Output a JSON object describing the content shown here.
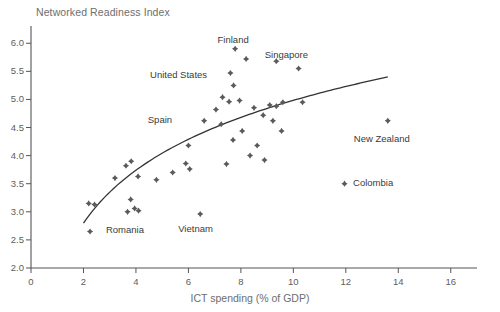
{
  "chart_data": {
    "type": "scatter",
    "title": "Networked Readiness Index",
    "xlabel": "ICT spending (% of GDP)",
    "ylabel": "Networked Readiness Index",
    "xlim": [
      0,
      17
    ],
    "ylim": [
      2.0,
      6.2
    ],
    "xticks": [
      0,
      2,
      4,
      6,
      8,
      10,
      12,
      14,
      16
    ],
    "xtick_labels": [
      "0",
      "2",
      "4",
      "6",
      "8",
      "10",
      "12",
      "14",
      "16"
    ],
    "yticks": [
      2.0,
      2.5,
      3.0,
      3.5,
      4.0,
      4.5,
      5.0,
      5.5,
      6.0
    ],
    "ytick_labels": [
      "2.0",
      "2.5",
      "3.0",
      "3.5",
      "4.0",
      "4.5",
      "5.0",
      "5.5",
      "6.0"
    ],
    "grid": false,
    "legend": null,
    "marker_color": "#5a5a5a",
    "trend_color": "#333333",
    "axis_color": "#555555",
    "points": [
      {
        "x": 2.25,
        "y": 2.65,
        "label": "Romania"
      },
      {
        "x": 2.2,
        "y": 3.15,
        "label": null
      },
      {
        "x": 2.42,
        "y": 3.13,
        "label": null
      },
      {
        "x": 3.2,
        "y": 3.6,
        "label": null
      },
      {
        "x": 3.62,
        "y": 3.82,
        "label": null
      },
      {
        "x": 3.82,
        "y": 3.9,
        "label": null
      },
      {
        "x": 3.68,
        "y": 3.0,
        "label": null
      },
      {
        "x": 3.8,
        "y": 3.22,
        "label": null
      },
      {
        "x": 3.95,
        "y": 3.06,
        "label": null
      },
      {
        "x": 4.1,
        "y": 3.02,
        "label": null
      },
      {
        "x": 4.08,
        "y": 3.63,
        "label": null
      },
      {
        "x": 4.78,
        "y": 3.57,
        "label": null
      },
      {
        "x": 5.4,
        "y": 3.7,
        "label": null
      },
      {
        "x": 5.9,
        "y": 3.86,
        "label": null
      },
      {
        "x": 6.05,
        "y": 3.76,
        "label": null
      },
      {
        "x": 7.45,
        "y": 3.85,
        "label": null
      },
      {
        "x": 6.45,
        "y": 2.96,
        "label": "Vietnam"
      },
      {
        "x": 6.0,
        "y": 4.18,
        "label": null
      },
      {
        "x": 6.6,
        "y": 4.62,
        "label": "Spain"
      },
      {
        "x": 7.25,
        "y": 4.56,
        "label": null
      },
      {
        "x": 7.7,
        "y": 4.28,
        "label": null
      },
      {
        "x": 8.05,
        "y": 4.44,
        "label": null
      },
      {
        "x": 8.35,
        "y": 4.0,
        "label": null
      },
      {
        "x": 8.62,
        "y": 4.18,
        "label": null
      },
      {
        "x": 7.05,
        "y": 4.82,
        "label": null
      },
      {
        "x": 7.3,
        "y": 5.04,
        "label": null
      },
      {
        "x": 7.55,
        "y": 4.96,
        "label": null
      },
      {
        "x": 7.95,
        "y": 4.98,
        "label": null
      },
      {
        "x": 7.72,
        "y": 5.25,
        "label": null
      },
      {
        "x": 7.6,
        "y": 5.47,
        "label": null
      },
      {
        "x": 7.78,
        "y": 5.9,
        "label": "Finland"
      },
      {
        "x": 8.2,
        "y": 5.72,
        "label": null
      },
      {
        "x": 9.35,
        "y": 5.68,
        "label": "Singapore"
      },
      {
        "x": 10.2,
        "y": 5.55,
        "label": null
      },
      {
        "x": 8.5,
        "y": 4.85,
        "label": null
      },
      {
        "x": 9.1,
        "y": 4.9,
        "label": null
      },
      {
        "x": 9.35,
        "y": 4.88,
        "label": null
      },
      {
        "x": 8.85,
        "y": 4.72,
        "label": null
      },
      {
        "x": 9.22,
        "y": 4.62,
        "label": null
      },
      {
        "x": 9.6,
        "y": 4.95,
        "label": null
      },
      {
        "x": 10.35,
        "y": 4.95,
        "label": null
      },
      {
        "x": 8.9,
        "y": 3.92,
        "label": null
      },
      {
        "x": 9.55,
        "y": 4.44,
        "label": null
      },
      {
        "x": 13.6,
        "y": 4.62,
        "label": "New Zealand"
      },
      {
        "x": 11.95,
        "y": 3.5,
        "label": "Colombia"
      }
    ],
    "trend_line": {
      "description": "Logarithmic best-fit curve rising from left to right",
      "x_start": 2.0,
      "y_start": 2.8,
      "x_end": 13.6,
      "y_end": 5.4
    },
    "annotations": [
      {
        "text": "Finland",
        "x": 7.95,
        "y": 6.02
      },
      {
        "text": "Singapore",
        "x": 9.9,
        "y": 5.78
      },
      {
        "text": "United States",
        "x": 6.9,
        "y": 5.42
      },
      {
        "text": "Spain",
        "x": 5.9,
        "y": 4.62
      },
      {
        "text": "Romania",
        "x": 2.55,
        "y": 2.65
      },
      {
        "text": "Vietnam",
        "x": 6.45,
        "y": 2.68
      },
      {
        "text": "New Zealand",
        "x": 13.6,
        "y": 4.3
      },
      {
        "text": "Colombia",
        "x": 12.2,
        "y": 3.5
      }
    ]
  }
}
